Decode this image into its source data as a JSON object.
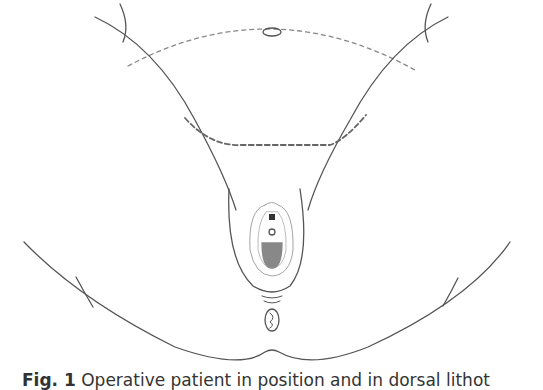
{
  "figure": {
    "line_color": "#555555",
    "dash_color": "#777777",
    "shade_color": "#888888"
  },
  "caption": {
    "label": "Fig. 1",
    "text": " Operative patient in position and in dorsal lithot"
  }
}
